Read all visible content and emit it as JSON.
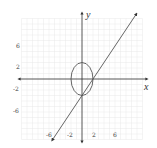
{
  "chart_data": {
    "type": "line",
    "title": "",
    "xlabel": "x",
    "ylabel": "y",
    "xlim": [
      -11,
      11
    ],
    "ylim": [
      -11,
      11
    ],
    "grid": true,
    "x_ticks": [
      -6,
      -2,
      2,
      6
    ],
    "y_ticks": [
      6,
      2,
      -2,
      -6
    ],
    "x_tick_labels": [
      "-6",
      "-2",
      "2",
      "6"
    ],
    "y_tick_labels": [
      "6",
      "2",
      "-2",
      "-6"
    ],
    "series": [
      {
        "name": "ellipse",
        "equation": "x^2/4 + y^2/9 = 1",
        "center": [
          0,
          0
        ],
        "semi_axis_x": 2,
        "semi_axis_y": 3
      },
      {
        "name": "line",
        "equation": "y = 1.5x - 3",
        "x": [
          -5.5,
          10.5
        ],
        "y": [
          -11.25,
          12.75
        ],
        "arrows": "both"
      }
    ],
    "intersections": [
      [
        0,
        -3
      ],
      [
        2,
        0
      ]
    ],
    "legend": null
  },
  "labels": {
    "x_axis": "x",
    "y_axis": "y",
    "xt0": "-6",
    "xt1": "-2",
    "xt2": "2",
    "xt3": "6",
    "yt0": "6",
    "yt1": "2",
    "yt2": "-2",
    "yt3": "-6"
  },
  "colors": {
    "grid": "#e6e6e6",
    "axis": "#333333",
    "curve": "#555555"
  }
}
